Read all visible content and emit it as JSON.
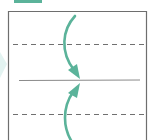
{
  "diagram": {
    "type": "origami-fold-step",
    "colors": {
      "accent": "#5bb39a",
      "outline": "#6e6e6e",
      "dashed": "#707070",
      "center_line": "#8a8a8a",
      "left_hint": "#e3f3f1",
      "background": "#ffffff"
    },
    "elements": {
      "header_tab": {
        "x": 14,
        "y": 0,
        "w": 28,
        "h": 3
      },
      "paper": {
        "left": 8,
        "top": 11,
        "right": 147,
        "bottom": 142
      },
      "fold_lines": [
        {
          "name": "upper-valley-fold",
          "style": "dashed",
          "y": 44
        },
        {
          "name": "center-crease",
          "style": "solid",
          "y": 80
        },
        {
          "name": "lower-valley-fold",
          "style": "dashed",
          "y": 114
        }
      ],
      "arrows": [
        {
          "name": "fold-down-arrow",
          "direction": "down",
          "target_y": 78
        },
        {
          "name": "fold-up-arrow",
          "direction": "up",
          "target_y": 83
        }
      ]
    }
  }
}
